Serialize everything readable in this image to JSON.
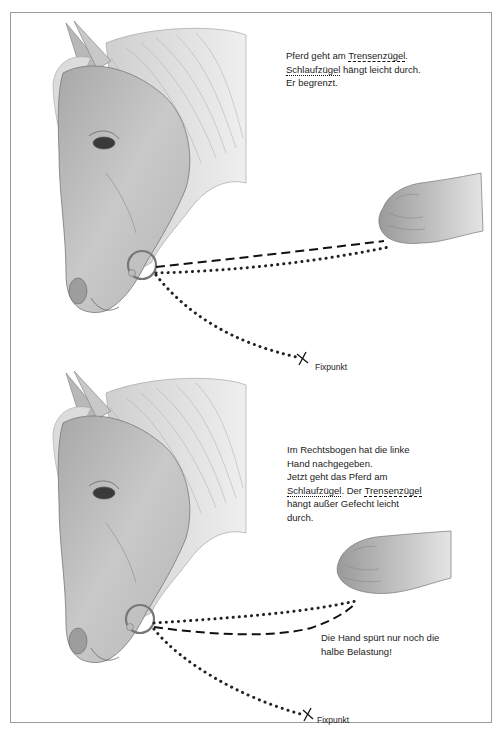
{
  "figure": {
    "top_panel": {
      "caption": {
        "line1_prefix": "Pferd geht am ",
        "line1_term": "Trensenzügel",
        "line1_suffix": ".",
        "line2_term": "Schlaufzügel",
        "line2_suffix": " hängt leicht durch.",
        "line3": "Er begrenzt."
      },
      "fixpoint_label": "Fixpunkt",
      "rein_legend": {
        "trensenzuegel_style": "dashed",
        "schlaufzuegel_style": "dotted"
      }
    },
    "bottom_panel": {
      "caption": {
        "line1": "Im Rechtsbogen hat die linke",
        "line2": "Hand nachgegeben.",
        "line3": "Jetzt geht das Pferd am",
        "line4_term1": "Schlaufzügel",
        "line4_mid": ". Der ",
        "line4_term2": "Trensenzügel",
        "line5": "hängt außer Gefecht leicht",
        "line6": "durch."
      },
      "note": {
        "line1": "Die Hand spürt nur noch die",
        "line2": "halbe Belastung!"
      },
      "fixpoint_label": "Fixpunkt"
    },
    "icons": {
      "horse_head": "horse-head-illustration",
      "hand": "hand-illustration",
      "bit_ring": "ring-icon",
      "fixpoint_marker": "cross-icon"
    },
    "colors": {
      "frame_border": "#9a9a9a",
      "ink": "#111111",
      "sketch_gray": "#8a8a8a"
    }
  }
}
